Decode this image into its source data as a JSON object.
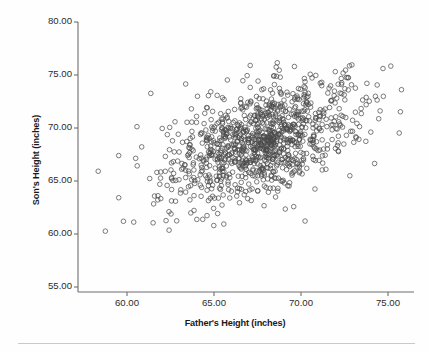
{
  "chart_data": {
    "type": "scatter",
    "title": "",
    "xlabel": "Father's Height (inches)",
    "ylabel": "Son's Height (inches)",
    "xlim": [
      57.2,
      76.8
    ],
    "ylim": [
      53.8,
      80.8
    ],
    "xticks": [
      60.0,
      65.0,
      70.0,
      75.0
    ],
    "yticks": [
      55.0,
      60.0,
      65.0,
      70.0,
      75.0,
      80.0
    ],
    "xtick_labels": [
      "60.00",
      "65.00",
      "70.00",
      "75.00"
    ],
    "ytick_labels": [
      "55.00",
      "60.00",
      "65.00",
      "70.00",
      "75.00",
      "80.00"
    ],
    "grid": false,
    "legend": null,
    "marker": "open-circle",
    "marker_color": "#4a4a4a",
    "marker_size_px": 4.6,
    "n_points": 1078,
    "stats": {
      "x_mean": 67.7,
      "y_mean": 68.7,
      "x_sd": 2.7,
      "y_sd": 2.8,
      "correlation": 0.5
    },
    "points_note": "Point coordinates generated from the bivariate-normal parameters above to reproduce the rendered cloud."
  },
  "axes": {
    "y_title": "Son's Height (inches)",
    "x_title": "Father's Height (inches)"
  },
  "colors": {
    "marker": "#4a4a4a",
    "axis": "#6d6d6d",
    "text": "#1a1a1a",
    "tick_text": "#2b2b2b",
    "background": "#fefefe",
    "footer_rule": "#c9c9c9"
  }
}
